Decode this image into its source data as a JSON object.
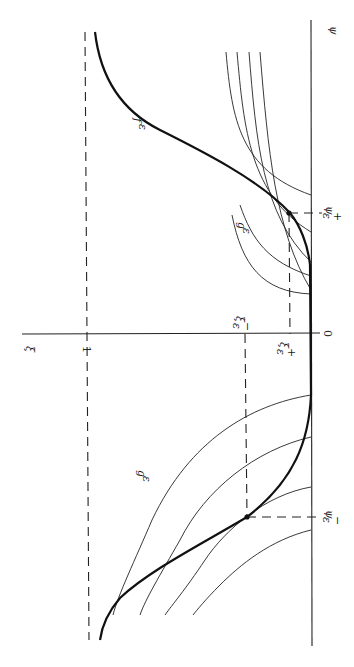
{
  "figure": {
    "rotation_note": "diagram drawn rotated 90 degrees clockwise",
    "axes": {
      "horizontal_axis_label": "ψ",
      "vertical_axis_label": "ξ",
      "origin_label": "0",
      "level_one_label": "1"
    },
    "curve_labels": {
      "f": "f",
      "f_sub": "ε",
      "g_upper": "g",
      "g_upper_sub": "ε",
      "g_lower": "g",
      "g_lower_sub": "ε"
    },
    "point_labels": {
      "psi_plus": "ψ",
      "psi_plus_sup": "+",
      "psi_plus_sub": "ε",
      "psi_minus": "ψ",
      "psi_minus_sup": "−",
      "psi_minus_sub": "ε",
      "xi_plus": "ξ",
      "xi_plus_sup": "+",
      "xi_plus_sub": "ε",
      "xi_minus": "ξ",
      "xi_minus_sup": "−",
      "xi_minus_sub": "ε"
    }
  }
}
